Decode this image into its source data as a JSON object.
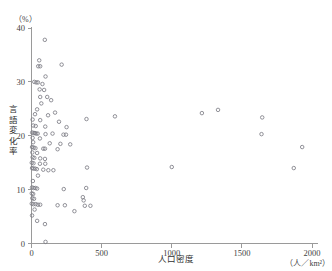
{
  "chart_data": {
    "type": "scatter",
    "title": "",
    "xlabel": "人口密度",
    "ylabel": "言語変化率",
    "x_unit": "（人／km²）",
    "y_unit": "（%）",
    "xlim": [
      0,
      2000
    ],
    "ylim": [
      0,
      40
    ],
    "xticks": [
      0,
      500,
      1000,
      1500,
      2000
    ],
    "xtick_labels": [
      "0",
      "500",
      "1000",
      "1500",
      "2000"
    ],
    "yticks": [
      0,
      10,
      20,
      30,
      40
    ],
    "ytick_labels": [
      "0",
      "10",
      "20",
      "30",
      "40"
    ],
    "grid": false,
    "legend": "none",
    "marker": "open-circle",
    "marker_color": "#7d7d85",
    "points": [
      [
        95,
        37.8
      ],
      [
        55,
        34.0
      ],
      [
        48,
        32.9
      ],
      [
        62,
        32.9
      ],
      [
        215,
        33.2
      ],
      [
        100,
        31.0
      ],
      [
        20,
        30.0
      ],
      [
        34,
        29.9
      ],
      [
        46,
        29.9
      ],
      [
        78,
        29.6
      ],
      [
        58,
        28.6
      ],
      [
        90,
        28.5
      ],
      [
        62,
        27.2
      ],
      [
        112,
        27.2
      ],
      [
        70,
        26.0
      ],
      [
        140,
        26.6
      ],
      [
        40,
        24.9
      ],
      [
        168,
        24.3
      ],
      [
        25,
        24.0
      ],
      [
        118,
        23.8
      ],
      [
        8,
        23.0
      ],
      [
        62,
        22.9
      ],
      [
        196,
        22.6
      ],
      [
        392,
        23.1
      ],
      [
        595,
        23.6
      ],
      [
        1215,
        24.2
      ],
      [
        1330,
        24.8
      ],
      [
        12,
        21.9
      ],
      [
        30,
        21.8
      ],
      [
        98,
        21.7
      ],
      [
        250,
        21.6
      ],
      [
        1645,
        23.4
      ],
      [
        5,
        20.6
      ],
      [
        16,
        20.5
      ],
      [
        24,
        20.5
      ],
      [
        33,
        20.4
      ],
      [
        44,
        20.4
      ],
      [
        100,
        20.3
      ],
      [
        150,
        20.4
      ],
      [
        228,
        20.2
      ],
      [
        246,
        20.2
      ],
      [
        8,
        19.6
      ],
      [
        60,
        19.5
      ],
      [
        1640,
        20.3
      ],
      [
        12,
        18.8
      ],
      [
        130,
        18.6
      ],
      [
        206,
        18.5
      ],
      [
        276,
        18.4
      ],
      [
        4,
        17.9
      ],
      [
        16,
        17.8
      ],
      [
        28,
        17.7
      ],
      [
        84,
        17.6
      ],
      [
        96,
        17.6
      ],
      [
        186,
        17.5
      ],
      [
        1930,
        17.9
      ],
      [
        6,
        16.9
      ],
      [
        40,
        16.8
      ],
      [
        8,
        16.0
      ],
      [
        20,
        15.9
      ],
      [
        62,
        15.8
      ],
      [
        96,
        15.7
      ],
      [
        2,
        15.0
      ],
      [
        14,
        14.9
      ],
      [
        60,
        14.8
      ],
      [
        98,
        14.8
      ],
      [
        4,
        14.0
      ],
      [
        14,
        13.9
      ],
      [
        26,
        13.9
      ],
      [
        38,
        13.8
      ],
      [
        84,
        13.7
      ],
      [
        120,
        13.6
      ],
      [
        156,
        13.6
      ],
      [
        396,
        14.1
      ],
      [
        1000,
        14.2
      ],
      [
        1870,
        14.0
      ],
      [
        46,
        12.6
      ],
      [
        10,
        11.6
      ],
      [
        4,
        10.4
      ],
      [
        16,
        10.3
      ],
      [
        28,
        10.3
      ],
      [
        40,
        10.2
      ],
      [
        230,
        10.1
      ],
      [
        390,
        10.3
      ],
      [
        2,
        9.3
      ],
      [
        12,
        9.2
      ],
      [
        6,
        8.4
      ],
      [
        18,
        8.3
      ],
      [
        366,
        8.6
      ],
      [
        372,
        8.0
      ],
      [
        2,
        7.4
      ],
      [
        14,
        7.3
      ],
      [
        30,
        7.3
      ],
      [
        46,
        7.2
      ],
      [
        62,
        7.2
      ],
      [
        186,
        7.1
      ],
      [
        238,
        7.1
      ],
      [
        380,
        7.0
      ],
      [
        420,
        7.0
      ],
      [
        22,
        6.3
      ],
      [
        306,
        6.0
      ],
      [
        4,
        5.2
      ],
      [
        40,
        4.2
      ],
      [
        96,
        3.6
      ],
      [
        100,
        0.3
      ]
    ]
  }
}
